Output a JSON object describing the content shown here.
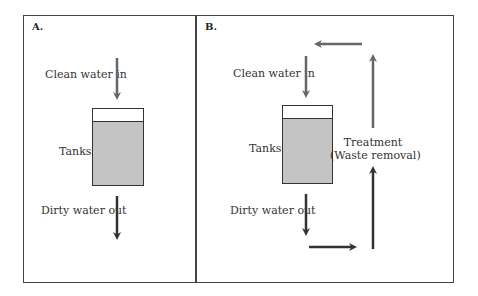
{
  "panels": {
    "a": {
      "label": "A.",
      "clean_in": "Clean water in",
      "tanks": "Tanks",
      "dirty_out": "Dirty water out"
    },
    "b": {
      "label": "B.",
      "clean_in": "Clean water in",
      "tanks": "Tanks",
      "dirty_out": "Dirty water out",
      "treatment_line1": "Treatment",
      "treatment_line2": "(Waste removal)"
    }
  },
  "colors": {
    "clean_arrow": "#666666",
    "dirty_arrow": "#333333",
    "tank_fill": "#c4c4c4",
    "frame": "#444444"
  }
}
